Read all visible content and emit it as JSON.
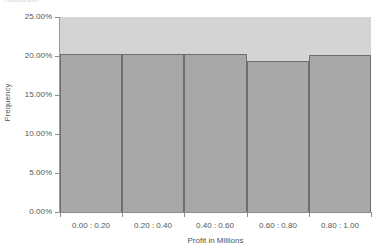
{
  "title_fragment": "Histogram",
  "chart_data": {
    "type": "bar",
    "title": "Histogram",
    "xlabel": "Profit in Millions",
    "ylabel": "Frequency",
    "categories": [
      "0.00 : 0.20",
      "0.20 : 0.40",
      "0.40 : 0.60",
      "0.60 : 0.80",
      "0.80 : 1.00"
    ],
    "values": [
      20.2,
      20.2,
      20.2,
      19.3,
      20.1
    ],
    "value_format": "percent",
    "ylim": [
      0,
      25
    ],
    "yticks": [
      0,
      5,
      10,
      15,
      20,
      25
    ],
    "ytick_labels": [
      "0.00%",
      "5.00%",
      "10.00%",
      "15.00%",
      "20.00%",
      "25.00%"
    ],
    "grid": false,
    "legend": false,
    "colors": {
      "bar_fill": "#a8a8a8",
      "bar_edge": "#6e6e6e",
      "plot_background": "#d4d4d4",
      "page_background": "#ffffff",
      "axis": "#8c8c8c",
      "text": "#555555"
    }
  }
}
